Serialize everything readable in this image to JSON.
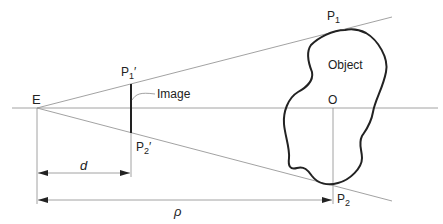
{
  "diagram": {
    "labels": {
      "eye": "E",
      "p1_prime": "P",
      "p1_prime_sub": "1",
      "p1_prime_mark": "′",
      "p2_prime": "P",
      "p2_prime_sub": "2",
      "p2_prime_mark": "′",
      "image": "Image",
      "p1": "P",
      "p1_sub": "1",
      "p2": "P",
      "p2_sub": "2",
      "object": "Object",
      "origin": "O",
      "dist_image": "d",
      "dist_object": "ρ"
    },
    "colors": {
      "thin_line": "#8a8a8a",
      "thick_line": "#222222",
      "text": "#222222"
    }
  }
}
